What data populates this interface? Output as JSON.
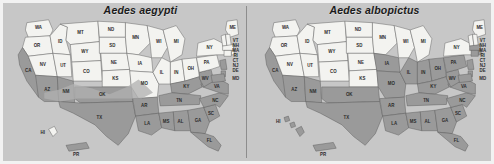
{
  "figure": {
    "background_color": "#c7c7c7",
    "frame_color": "#f2f2f2",
    "divider_color": "#8d8d8d",
    "shaded_color": "#9a9a9a",
    "unshaded_color": "#f3f3f0"
  },
  "panels": [
    {
      "id": "aedes-aegypti",
      "title": "Aedes aegypti",
      "shaded_states": [
        "CA",
        "AZ",
        "NM",
        "TX",
        "OK",
        "AR",
        "LA",
        "MS",
        "AL",
        "GA",
        "FL",
        "SC",
        "NC",
        "TN",
        "KY",
        "VA",
        "WV",
        "MD",
        "DE",
        "NJ",
        "MO",
        "PR"
      ],
      "unshaded_states": [
        "WA",
        "OR",
        "ID",
        "MT",
        "WY",
        "NV",
        "UT",
        "CO",
        "ND",
        "SD",
        "NE",
        "KS",
        "MN",
        "IA",
        "WI",
        "MI",
        "IL",
        "IN",
        "OH",
        "PA",
        "NY",
        "VT",
        "NH",
        "ME",
        "MA",
        "RI",
        "CT",
        "HI"
      ]
    },
    {
      "id": "aedes-albopictus",
      "title": "Aedes albopictus",
      "shaded_states": [
        "CA",
        "AZ",
        "NM",
        "TX",
        "OK",
        "AR",
        "LA",
        "MS",
        "AL",
        "GA",
        "FL",
        "SC",
        "NC",
        "TN",
        "KY",
        "VA",
        "WV",
        "MD",
        "DE",
        "NJ",
        "PA",
        "NY",
        "MO",
        "IA",
        "IL",
        "IN",
        "OH",
        "MI",
        "WI",
        "HI",
        "PR",
        "CT",
        "MA",
        "RI",
        "NH",
        "VT",
        "ME"
      ],
      "unshaded_states": [
        "WA",
        "OR",
        "ID",
        "MT",
        "WY",
        "NV",
        "UT",
        "CO",
        "ND",
        "SD",
        "NE",
        "KS",
        "MN"
      ]
    }
  ],
  "states": [
    {
      "abbr": "WA"
    },
    {
      "abbr": "OR"
    },
    {
      "abbr": "CA"
    },
    {
      "abbr": "NV"
    },
    {
      "abbr": "ID"
    },
    {
      "abbr": "UT"
    },
    {
      "abbr": "AZ"
    },
    {
      "abbr": "MT"
    },
    {
      "abbr": "WY"
    },
    {
      "abbr": "CO"
    },
    {
      "abbr": "NM"
    },
    {
      "abbr": "ND"
    },
    {
      "abbr": "SD"
    },
    {
      "abbr": "NE"
    },
    {
      "abbr": "KS"
    },
    {
      "abbr": "OK"
    },
    {
      "abbr": "TX"
    },
    {
      "abbr": "MN"
    },
    {
      "abbr": "IA"
    },
    {
      "abbr": "MO"
    },
    {
      "abbr": "AR"
    },
    {
      "abbr": "LA"
    },
    {
      "abbr": "WI"
    },
    {
      "abbr": "IL"
    },
    {
      "abbr": "MS"
    },
    {
      "abbr": "MI"
    },
    {
      "abbr": "IN"
    },
    {
      "abbr": "KY"
    },
    {
      "abbr": "TN"
    },
    {
      "abbr": "AL"
    },
    {
      "abbr": "OH"
    },
    {
      "abbr": "GA"
    },
    {
      "abbr": "FL"
    },
    {
      "abbr": "SC"
    },
    {
      "abbr": "NC"
    },
    {
      "abbr": "VA"
    },
    {
      "abbr": "WV"
    },
    {
      "abbr": "PA"
    },
    {
      "abbr": "NY"
    },
    {
      "abbr": "ME"
    },
    {
      "abbr": "VT"
    },
    {
      "abbr": "NH"
    },
    {
      "abbr": "MA"
    },
    {
      "abbr": "RI"
    },
    {
      "abbr": "CT"
    },
    {
      "abbr": "NJ"
    },
    {
      "abbr": "DE"
    },
    {
      "abbr": "MD"
    },
    {
      "abbr": "HI"
    },
    {
      "abbr": "PR"
    }
  ]
}
